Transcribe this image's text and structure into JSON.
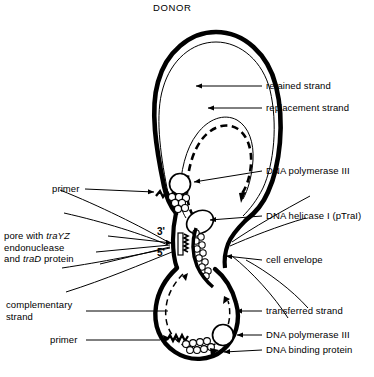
{
  "figure": {
    "title": "DONOR"
  },
  "labels": {
    "retained_strand": "retained strand",
    "replacement_strand": "replacement  strand",
    "dna_polymerase_iii_top": "DNA polymerase III",
    "dna_helicase": "DNA helicase I (pTraI)",
    "cell_envelope": "cell envelope",
    "transferred_strand": "transferred strand",
    "dna_polymerase_iii_bottom": "DNA polymerase III",
    "dna_binding_protein": "DNA binding protein",
    "primer_top": "primer",
    "primer_bottom": "primer",
    "complementary_strand_line1": "complementary",
    "complementary_strand_line2": "strand",
    "pore_line1_pre": "pore with ",
    "pore_line1_italic": "traYZ",
    "pore_line2": "endonuclease",
    "pore_line3_pre": "and ",
    "pore_line3_italic": "traD",
    "pore_line3_post": " protein"
  },
  "ticks": {
    "three_prime": "3'",
    "five_prime": "5'"
  },
  "colors": {
    "ink": "#000000",
    "background": "#ffffff"
  }
}
